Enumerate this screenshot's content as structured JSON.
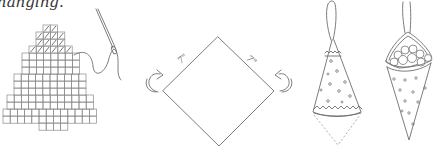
{
  "caption": "hanging.",
  "colors": {
    "line": "#6e6e6e",
    "background": "#ffffff",
    "text": "#333333"
  },
  "figures": [
    {
      "name": "cross-stitch-tree",
      "description": "Grid tree with hatched stitched top rows, needle and thread"
    },
    {
      "name": "folded-square",
      "labels": [
        "7\"",
        "7\""
      ],
      "description": "Diamond square with fold arrows on both sides"
    },
    {
      "name": "cone-ornament-open",
      "description": "Cone with zigzag trim, dots and dashed fold-over flap, hanging loop"
    },
    {
      "name": "cone-ornament-filled",
      "description": "Cone filled with round candies, dotted pattern, hanging loop"
    }
  ],
  "diamond": {
    "side_label_left": "7\"",
    "side_label_right": "7\""
  }
}
